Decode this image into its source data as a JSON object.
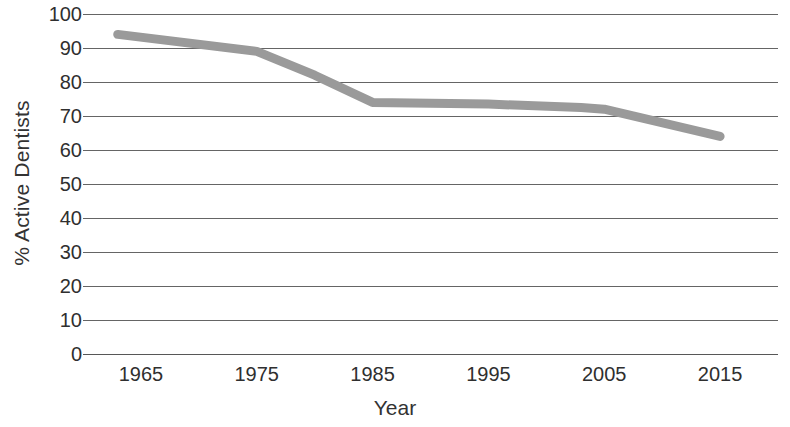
{
  "chart_data": {
    "type": "line",
    "title": "",
    "xlabel": "Year",
    "ylabel": "% Active Dentists",
    "xlim": [
      1960,
      2020
    ],
    "ylim": [
      0,
      100
    ],
    "grid": true,
    "legend": "none",
    "line_color": "#9a9a9a",
    "axis_color": "#3f3f3f",
    "x_ticks": [
      1965,
      1975,
      1985,
      1995,
      2005,
      2015
    ],
    "y_ticks": [
      100,
      90,
      80,
      70,
      60,
      50,
      40,
      30,
      20,
      10,
      0
    ],
    "x": [
      1963,
      1975,
      1980,
      1985,
      1995,
      2003,
      2005,
      2015
    ],
    "values": [
      94,
      89,
      82,
      74,
      73.5,
      72.5,
      72,
      64
    ],
    "series": [
      {
        "name": "% Active Dentists",
        "x": [
          1963,
          1975,
          1980,
          1985,
          1995,
          2003,
          2005,
          2015
        ],
        "values": [
          94,
          89,
          82,
          74,
          73.5,
          72.5,
          72,
          64
        ]
      }
    ]
  },
  "axes": {
    "y_title": "% Active Dentists",
    "x_title": "Year",
    "y_tick_labels": [
      "100",
      "90",
      "80",
      "70",
      "60",
      "50",
      "40",
      "30",
      "20",
      "10",
      "0"
    ],
    "x_tick_labels": [
      "1965",
      "1975",
      "1985",
      "1995",
      "2005",
      "2015"
    ]
  }
}
